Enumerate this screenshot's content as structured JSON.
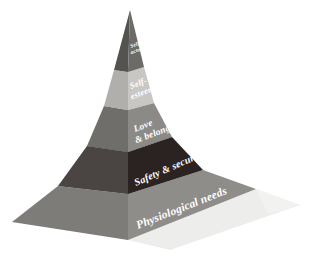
{
  "figure": {
    "name": "maslow-hierarchy-of-needs-pyramid",
    "background_color": "#ffffff",
    "view": "3d-pyramid-isometric",
    "text_color": "#ffffff"
  },
  "geometry": {
    "apex": [
      130,
      10
    ],
    "front_corner": [
      128,
      240
    ],
    "left_corner": [
      12,
      222
    ],
    "right_corner": [
      256,
      189
    ],
    "shadow_color": "#ececeb"
  },
  "tiers": [
    {
      "id": "tier-self-actualization",
      "label": "Self-\nactualization",
      "label_lines": [
        "Self-",
        "actualization"
      ],
      "level": 5,
      "right_face_color": "#6d6b68",
      "left_face_color": "#555350",
      "top_face_color": "#8d8b88",
      "font_size": 5.4,
      "text_rotation": 17
    },
    {
      "id": "tier-self-esteem",
      "label": "Self-\nesteem",
      "label_lines": [
        "Self-",
        "esteem"
      ],
      "level": 4,
      "right_face_color": "#c8c7c3",
      "left_face_color": "#b0afab",
      "top_face_color": "#d8d7d4",
      "font_size": 8.6,
      "text_rotation": 17
    },
    {
      "id": "tier-love-belonging",
      "label": "Love\n& belonging",
      "label_lines": [
        "Love",
        "& belonging"
      ],
      "level": 3,
      "right_face_color": "#8b8a87",
      "left_face_color": "#6f6e6b",
      "top_face_color": "#a3a29f",
      "font_size": 9.4,
      "text_rotation": 17
    },
    {
      "id": "tier-safety-security",
      "label": "Safety & security",
      "label_lines": [
        "Safety & security"
      ],
      "level": 2,
      "right_face_color": "#2b2322",
      "left_face_color": "#4a4543",
      "top_face_color": "#3a3130",
      "font_size": 10.2,
      "text_rotation": 17
    },
    {
      "id": "tier-physiological-needs",
      "label": "Physiological needs",
      "label_lines": [
        "Physiological needs"
      ],
      "level": 1,
      "right_face_color": "#8e8d8a",
      "left_face_color": "#7d7c79",
      "top_face_color": "#a5a4a1",
      "font_size": 11.4,
      "text_rotation": 17
    }
  ]
}
